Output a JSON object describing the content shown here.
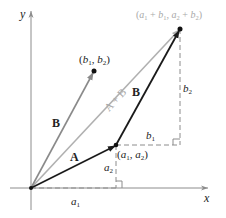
{
  "diagram": {
    "colors": {
      "axis": "#8c8c8c",
      "vector_dark": "#1a1a1a",
      "vector_gray": "#8a8a8a",
      "vector_sum": "#b0b0b0",
      "dashed": "#8c8c8c",
      "label": "#222222",
      "label_light": "#a8a8a8"
    },
    "axes": {
      "x_label": "x",
      "y_label": "y"
    },
    "origin": {
      "x": 31,
      "y": 188
    },
    "points": {
      "a": {
        "x": 116,
        "y": 145,
        "label": "(a1, a2)"
      },
      "b": {
        "x": 94,
        "y": 71,
        "label": "(b1, b2)"
      },
      "sum": {
        "x": 180,
        "y": 29,
        "label": "(a1 + b1, a2 + b2)"
      }
    },
    "vectors": [
      {
        "name": "A",
        "label": "A",
        "from": "origin",
        "to": "a",
        "style": "dark"
      },
      {
        "name": "B-from-origin",
        "label": "B",
        "from": "origin",
        "to": "b",
        "style": "gray"
      },
      {
        "name": "B-translated",
        "label": "B",
        "from": "a",
        "to": "sum",
        "style": "dark"
      },
      {
        "name": "A-plus-B",
        "label": "A + B",
        "from": "origin",
        "to": "sum",
        "style": "light"
      }
    ],
    "component_labels": {
      "a1": "a1",
      "a2": "a2",
      "b1": "b1",
      "b2": "b2"
    }
  }
}
